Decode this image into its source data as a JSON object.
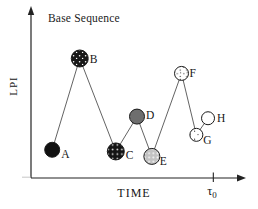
{
  "chart_data": {
    "type": "scatter-line",
    "title": "Base Sequence",
    "xlabel": "TIME",
    "ylabel": "LPI",
    "x_axis_marker": {
      "symbol": "τ",
      "subscript": "0",
      "x": 0.86
    },
    "axes_note": "schematic plot, no numeric ticks; point values normalized 0-1 within axis box",
    "connected": true,
    "points": [
      {
        "label": "A",
        "x": 0.1,
        "y": 0.17,
        "style": "solid-black",
        "r": 7.5,
        "label_dx": 9,
        "label_dy": 8
      },
      {
        "label": "B",
        "x": 0.23,
        "y": 0.72,
        "style": "black-white-speckle",
        "r": 8.5,
        "label_dx": 10,
        "label_dy": 5
      },
      {
        "label": "C",
        "x": 0.4,
        "y": 0.16,
        "style": "black-white-dots",
        "r": 8.5,
        "label_dx": 10,
        "label_dy": 8
      },
      {
        "label": "D",
        "x": 0.5,
        "y": 0.37,
        "style": "solid-gray",
        "r": 7.5,
        "label_dx": 9,
        "label_dy": 2
      },
      {
        "label": "E",
        "x": 0.57,
        "y": 0.13,
        "style": "light-gray-stipple",
        "r": 8.0,
        "label_dx": 8,
        "label_dy": 9
      },
      {
        "label": "F",
        "x": 0.71,
        "y": 0.63,
        "style": "white-black-stipple",
        "r": 7.0,
        "label_dx": 8,
        "label_dy": 4
      },
      {
        "label": "G",
        "x": 0.78,
        "y": 0.26,
        "style": "white-sparse-dots",
        "r": 6.5,
        "label_dx": 7,
        "label_dy": 9
      },
      {
        "label": "H",
        "x": 0.835,
        "y": 0.36,
        "style": "white-plain",
        "r": 6.5,
        "label_dx": 9,
        "label_dy": 4
      }
    ]
  },
  "colors": {
    "ink": "#161616",
    "axis": "#222222",
    "connector": "#474747",
    "solid_black_fill": "#111111",
    "solid_gray_fill": "#6e6e6e",
    "light_gray_fill": "#c2c2c2",
    "white_fill": "#ffffff"
  }
}
